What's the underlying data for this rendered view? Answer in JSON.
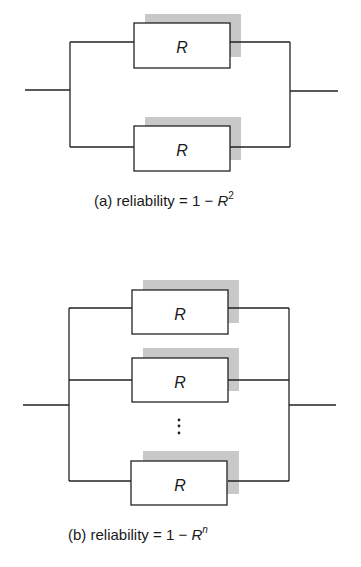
{
  "diagram_a": {
    "components": [
      "R",
      "R"
    ],
    "caption_prefix": "(a) reliability = 1 − ",
    "caption_var": "R",
    "caption_exp": "2"
  },
  "diagram_b": {
    "components": [
      "R",
      "R",
      "R"
    ],
    "ellipsis": "⋮",
    "caption_prefix": "(b) reliability = 1 − ",
    "caption_var": "R",
    "caption_exp": "n"
  },
  "colors": {
    "line": "#222222",
    "shadow": "#c8c8c8"
  }
}
